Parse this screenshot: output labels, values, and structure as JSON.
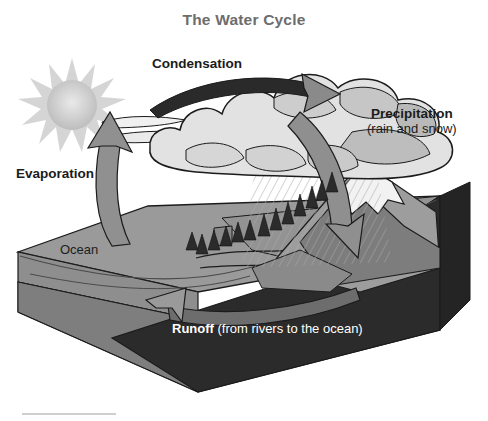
{
  "diagram": {
    "title": "The Water Cycle",
    "title_color": "#6d6d6d",
    "background": "#ffffff",
    "labels": {
      "condensation": "Condensation",
      "precipitation": "Precipitation",
      "precipitation_sub": "(rain and snow)",
      "evaporation": "Evaporation",
      "ocean": "Ocean",
      "runoff": "Runoff ",
      "runoff_sub": "(from rivers to the ocean)"
    },
    "elements": {
      "sun": "sun-icon",
      "cloud": "cloud-shape",
      "mountain": "mountain-shape",
      "snow_cap": "snow-cap-shape",
      "trees": "conifer-trees",
      "rain": "rain-hatching",
      "ocean_block": "ocean-block-3d",
      "evaporation_arrow": "evaporation-arrow",
      "condensation_arrow": "condensation-arrow",
      "precipitation_arrow": "precipitation-arrow",
      "runoff_arrow": "runoff-arrow"
    },
    "colors": {
      "sun": "#cfcfcf",
      "cloud_light": "#e4e4e4",
      "cloud_mid": "#cbcbcb",
      "cloud_dark": "#b3b3b3",
      "arrow_gray": "#8f8f8f",
      "arrow_dark": "#2a2a2a",
      "ocean_top": "#9a9a9a",
      "ocean_front": "#8e8e8e",
      "land_dark": "#2d2d2d",
      "mountain_light": "#e8e8e8",
      "mountain_mid": "#9d9d9d",
      "mountain_dark": "#6f6f6f",
      "outline": "#1b1b1b"
    }
  }
}
